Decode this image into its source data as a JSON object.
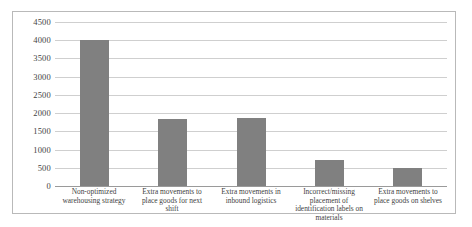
{
  "chart_data": {
    "type": "bar",
    "title": "",
    "subtitle": "",
    "xlabel": "",
    "ylabel": "",
    "ylim": [
      0,
      4500
    ],
    "ytick_step": 500,
    "grid": true,
    "legend": false,
    "bar_color": "#808080",
    "gridline_color": "#cfcfcf",
    "frame_color": "#b9b9b9",
    "categories": [
      "Non-optimized warehousing strategy",
      "Extra movements to place goods for next shift",
      "Extra movements in inbound logistics",
      "Incorrect/missing placement of identification labels on materials",
      "Extra movements to place goods on shelves"
    ],
    "values": [
      4000,
      1850,
      1870,
      700,
      500
    ],
    "ytick_labels": [
      "4500",
      "4000",
      "3500",
      "3000",
      "2500",
      "2000",
      "1500",
      "1000",
      "500",
      "0"
    ],
    "ytick_values": [
      4500,
      4000,
      3500,
      3000,
      2500,
      2000,
      1500,
      1000,
      500,
      0
    ]
  }
}
